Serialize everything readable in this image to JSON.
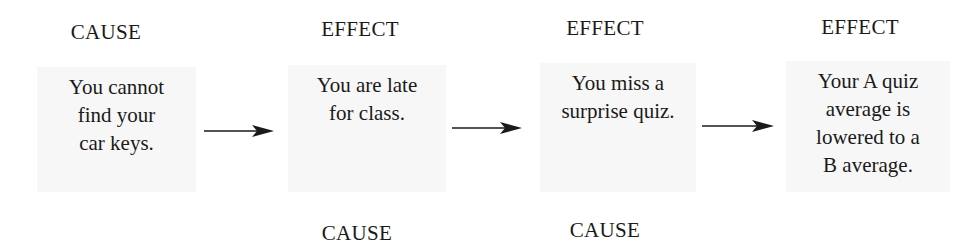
{
  "diagram": {
    "type": "cause-effect-chain",
    "top_labels": [
      "CAUSE",
      "EFFECT",
      "EFFECT",
      "EFFECT"
    ],
    "bottom_labels": [
      "",
      "CAUSE",
      "CAUSE",
      ""
    ],
    "boxes": [
      {
        "text": "You cannot\nfind your\ncar keys."
      },
      {
        "text": "You are late\nfor class."
      },
      {
        "text": "You miss a\nsurprise quiz."
      },
      {
        "text": "Your A quiz\naverage is\nlowered to a\nB average."
      }
    ],
    "arrows": [
      {
        "icon": "arrow-right-icon"
      },
      {
        "icon": "arrow-right-icon"
      },
      {
        "icon": "arrow-right-icon"
      }
    ],
    "colors": {
      "text": "#1a1a1a",
      "box_background": "#f7f7f7",
      "arrow": "#1a1a1a",
      "background": "#ffffff"
    }
  }
}
